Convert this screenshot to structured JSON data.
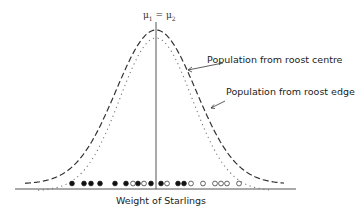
{
  "chart_data": {
    "type": "line",
    "title": "",
    "xlabel": "Weight of Starlings",
    "ylabel": "",
    "annotation_top": "μ1 = μ2",
    "series": [
      {
        "name": "Population from roost centre",
        "style": "dashed",
        "mean_x": 156,
        "relative_spread": "wider",
        "relative_peak": "higher"
      },
      {
        "name": "Population from roost edge",
        "style": "dotted",
        "mean_x": 156,
        "relative_spread": "narrower",
        "relative_peak": "lower"
      }
    ],
    "sample_points": [
      {
        "x": 72,
        "type": "filled"
      },
      {
        "x": 84,
        "type": "filled"
      },
      {
        "x": 91,
        "type": "filled"
      },
      {
        "x": 100,
        "type": "filled"
      },
      {
        "x": 115,
        "type": "filled"
      },
      {
        "x": 126,
        "type": "filled"
      },
      {
        "x": 133,
        "type": "open"
      },
      {
        "x": 138,
        "type": "filled"
      },
      {
        "x": 144,
        "type": "open"
      },
      {
        "x": 151,
        "type": "filled"
      },
      {
        "x": 161,
        "type": "filled"
      },
      {
        "x": 167,
        "type": "open"
      },
      {
        "x": 178,
        "type": "filled"
      },
      {
        "x": 184,
        "type": "filled"
      },
      {
        "x": 191,
        "type": "open"
      },
      {
        "x": 203,
        "type": "open"
      },
      {
        "x": 215,
        "type": "open"
      },
      {
        "x": 221,
        "type": "open"
      },
      {
        "x": 227,
        "type": "open"
      },
      {
        "x": 239,
        "type": "open"
      }
    ],
    "legend": [
      "Population from roost centre",
      "Population from roost edge"
    ]
  },
  "labels": {
    "mu_main": "μ",
    "mu_sub1": "1",
    "eq": " = ",
    "mu_sub2": "2",
    "centre": "Population from roost centre",
    "edge": "Population from roost edge",
    "xaxis": "Weight of Starlings"
  }
}
